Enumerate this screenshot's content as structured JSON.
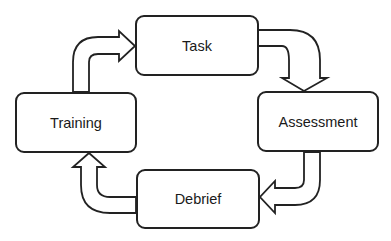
{
  "diagram": {
    "type": "cycle",
    "nodes": [
      {
        "id": "task",
        "label": "Task"
      },
      {
        "id": "assessment",
        "label": "Assessment"
      },
      {
        "id": "debrief",
        "label": "Debrief"
      },
      {
        "id": "training",
        "label": "Training"
      }
    ],
    "edges": [
      {
        "from": "training",
        "to": "task"
      },
      {
        "from": "task",
        "to": "assessment"
      },
      {
        "from": "assessment",
        "to": "debrief"
      },
      {
        "from": "debrief",
        "to": "training"
      }
    ],
    "colors": {
      "stroke": "#222222",
      "fill": "#ffffff",
      "text": "#1a1a1a"
    }
  }
}
